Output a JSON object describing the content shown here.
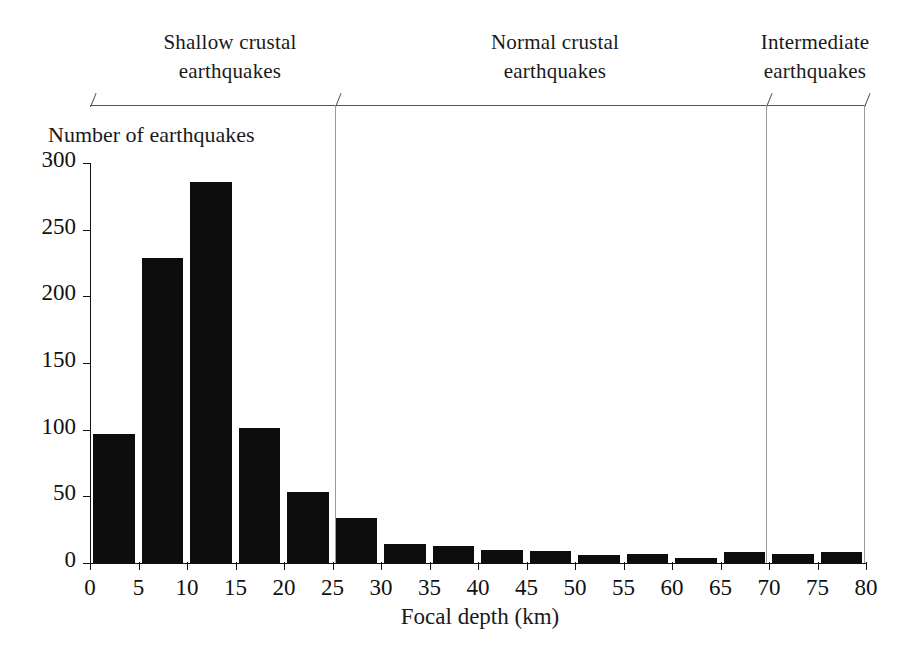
{
  "chart_data": {
    "type": "bar",
    "title": "",
    "subtitle": "",
    "xlabel": "Focal depth (km)",
    "ylabel": "Number of earthquakes",
    "xlim": [
      0,
      80
    ],
    "ylim": [
      0,
      300
    ],
    "grid": false,
    "legend": null,
    "bin_width": 5,
    "bin_edges": [
      0,
      5,
      10,
      15,
      20,
      25,
      30,
      35,
      40,
      45,
      50,
      55,
      60,
      65,
      70,
      75,
      80
    ],
    "categories": [
      "0-5",
      "5-10",
      "10-15",
      "15-20",
      "20-25",
      "25-30",
      "30-35",
      "35-40",
      "40-45",
      "45-50",
      "50-55",
      "55-60",
      "60-65",
      "65-70",
      "70-75",
      "75-80"
    ],
    "values": [
      97,
      229,
      286,
      101,
      53,
      34,
      14,
      13,
      10,
      9,
      6,
      7,
      4,
      8,
      7,
      8
    ],
    "xticks": [
      0,
      5,
      10,
      15,
      20,
      25,
      30,
      35,
      40,
      45,
      50,
      55,
      60,
      65,
      70,
      75,
      80
    ],
    "xtick_labels": [
      "0",
      "5",
      "10",
      "15",
      "20",
      "25",
      "30",
      "35",
      "40",
      "45",
      "50",
      "55",
      "60",
      "65",
      "70",
      "75",
      "80"
    ],
    "yticks": [
      0,
      50,
      100,
      150,
      200,
      250,
      300
    ],
    "ytick_labels": [
      "0",
      "50",
      "100",
      "150",
      "200",
      "250",
      "300"
    ],
    "bar_color": "#0d0d0d",
    "axis_color": "#111111",
    "annotations": [
      {
        "id": "shallow",
        "line1": "Shallow crustal",
        "line2": "earthquakes",
        "range": [
          0,
          25
        ]
      },
      {
        "id": "normal",
        "line1": "Normal crustal",
        "line2": "earthquakes",
        "range": [
          25,
          70
        ]
      },
      {
        "id": "intermediate",
        "line1": "Intermediate",
        "line2": "earthquakes",
        "range": [
          70,
          80
        ]
      }
    ]
  },
  "axis_titles": {
    "y": "Number of earthquakes",
    "x": "Focal depth (km)"
  },
  "bands": {
    "shallow": {
      "line1": "Shallow crustal",
      "line2": "earthquakes"
    },
    "normal": {
      "line1": "Normal crustal",
      "line2": "earthquakes"
    },
    "intermediate": {
      "line1": "Intermediate",
      "line2": "earthquakes"
    }
  }
}
